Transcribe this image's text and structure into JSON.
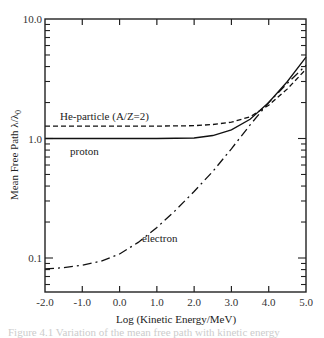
{
  "chart_data": {
    "type": "line",
    "title": "",
    "xlabel": "Log (Kinetic Energy/MeV)",
    "ylabel": "Mean Free Path λ/λ0",
    "xlim": [
      -2.0,
      5.0
    ],
    "ylim": [
      0.053,
      10.0
    ],
    "yscale": "log",
    "grid": false,
    "legend": "inline annotations",
    "x_ticks": [
      "-2.0",
      "-1.0",
      "0.0",
      "1.0",
      "2.0",
      "3.0",
      "4.0",
      "5.0"
    ],
    "y_ticks": [
      "0.1",
      "1.0",
      "10.0"
    ],
    "series": [
      {
        "name": "proton",
        "style": "solid",
        "x": [
          -2.0,
          -1.0,
          0.0,
          1.0,
          2.0,
          2.5,
          3.0,
          3.5,
          4.0,
          4.5,
          5.0
        ],
        "values": [
          1.0,
          1.0,
          1.0,
          1.0,
          1.01,
          1.06,
          1.18,
          1.45,
          2.0,
          3.0,
          4.8
        ]
      },
      {
        "name": "He-particle (A/Z=2)",
        "style": "dashed",
        "x": [
          -2.0,
          -1.0,
          0.0,
          1.0,
          2.0,
          2.5,
          3.0,
          3.5,
          4.0,
          4.5,
          5.0
        ],
        "values": [
          1.27,
          1.27,
          1.27,
          1.27,
          1.28,
          1.31,
          1.37,
          1.52,
          1.9,
          2.6,
          3.8
        ]
      },
      {
        "name": "electron",
        "style": "dash-dot",
        "x": [
          -2.0,
          -1.5,
          -1.0,
          -0.5,
          0.0,
          0.5,
          1.0,
          1.5,
          2.0,
          2.5,
          3.0,
          3.5,
          4.0,
          4.5,
          5.0
        ],
        "values": [
          0.081,
          0.083,
          0.087,
          0.094,
          0.108,
          0.135,
          0.18,
          0.25,
          0.36,
          0.53,
          0.82,
          1.3,
          2.0,
          2.9,
          4.1
        ]
      }
    ],
    "annotations": [
      {
        "text": "He-particle (A/Z=2)",
        "x": -1.6,
        "y": 1.45
      },
      {
        "text": "proton",
        "x": -1.3,
        "y": 0.87
      },
      {
        "text": "electron",
        "x": 2.7,
        "y": 0.13
      }
    ]
  },
  "labels": {
    "xlabel": "Log (Kinetic Energy/MeV)",
    "ylabel": "Mean Free Path λ/λ",
    "ylabel_sub": "0",
    "he": "He-particle (A/Z=2)",
    "proton": "proton",
    "electron": "electron",
    "caption": "Figure 4.1  Variation of the mean free path with kinetic energy"
  }
}
